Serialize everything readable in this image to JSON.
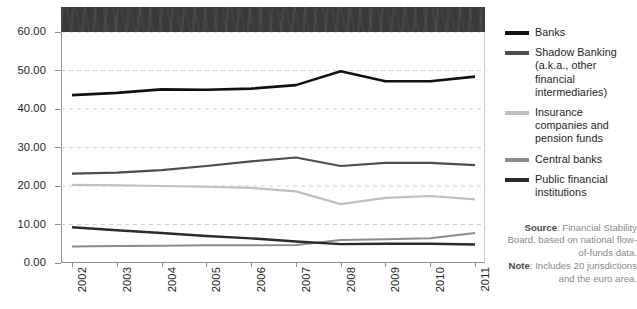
{
  "chart_data": {
    "type": "line",
    "title": "",
    "xlabel": "",
    "ylabel": "",
    "ylim": [
      0,
      60
    ],
    "yticks": [
      0,
      10,
      20,
      30,
      40,
      50,
      60
    ],
    "ytick_labels": [
      "0.00",
      "10.00",
      "20.00",
      "30.00",
      "40.00",
      "50.00",
      "60.00"
    ],
    "grid": "horizontal-dashed",
    "legend_position": "right",
    "categories": [
      "2002",
      "2003",
      "2004",
      "2005",
      "2006",
      "2007",
      "2008",
      "2009",
      "2010",
      "2011"
    ],
    "series": [
      {
        "name": "Banks",
        "color": "#111111",
        "values": [
          43.6,
          44.2,
          45.1,
          45.0,
          45.3,
          46.2,
          49.8,
          47.2,
          47.2,
          48.4
        ]
      },
      {
        "name": "Shadow Banking (a.k.a., other financial intermediaries)",
        "color": "#4d4d4d",
        "values": [
          23.2,
          23.5,
          24.1,
          25.2,
          26.4,
          27.4,
          25.2,
          26.0,
          26.0,
          25.4
        ]
      },
      {
        "name": "Insurance companies and pension funds",
        "color": "#bfbfbf",
        "values": [
          20.3,
          20.2,
          20.0,
          19.8,
          19.5,
          18.6,
          15.3,
          16.9,
          17.4,
          16.5
        ]
      },
      {
        "name": "Central banks",
        "color": "#8c8c8c",
        "values": [
          4.3,
          4.4,
          4.5,
          4.6,
          4.6,
          4.7,
          6.0,
          6.2,
          6.4,
          7.8
        ]
      },
      {
        "name": "Public financial institutions",
        "color": "#2b2b2b",
        "values": [
          9.3,
          8.5,
          7.8,
          7.0,
          6.4,
          5.6,
          4.9,
          5.0,
          5.0,
          4.8
        ]
      }
    ]
  },
  "title_band": {
    "label": ""
  },
  "legend": {
    "items": [
      {
        "label": "Banks",
        "color": "#111111"
      },
      {
        "label": "Shadow Banking (a.k.a., other financial intermediaries)",
        "color": "#4d4d4d"
      },
      {
        "label": "Insurance companies and pension funds",
        "color": "#bfbfbf"
      },
      {
        "label": "Central banks",
        "color": "#8c8c8c"
      },
      {
        "label": "Public financial institutions",
        "color": "#2b2b2b"
      }
    ]
  },
  "credits": {
    "source_label": "Source",
    "source_text": ": Financial Stability Board, based on national flow-of-funds data.",
    "note_label": "Note",
    "note_text": ": Includes 20 jurisdictions and the euro area."
  }
}
